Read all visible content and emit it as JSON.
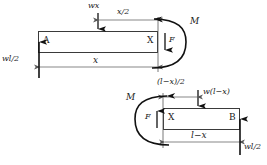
{
  "figure": {
    "stroke_color": "#262626",
    "beam_fill": "#ffffff",
    "beam_stroke": "#3a3a3a",
    "dim_color": "#555555"
  },
  "segment_left": {
    "name": "left-segment",
    "node_start_label": "A",
    "node_cut_label": "X",
    "load_label": "wx",
    "load_arm_label": "x/2",
    "span_label": "x",
    "reaction_label": "wl/2",
    "moment_label": "M",
    "shear_label": "F"
  },
  "segment_right": {
    "name": "right-segment",
    "node_cut_label": "X",
    "node_end_label": "B",
    "load_label": "w(l−x)",
    "load_arm_label": "(l−x)/2",
    "span_label": "l−x",
    "reaction_label": "wl/2",
    "moment_label": "M",
    "shear_label": "F"
  }
}
